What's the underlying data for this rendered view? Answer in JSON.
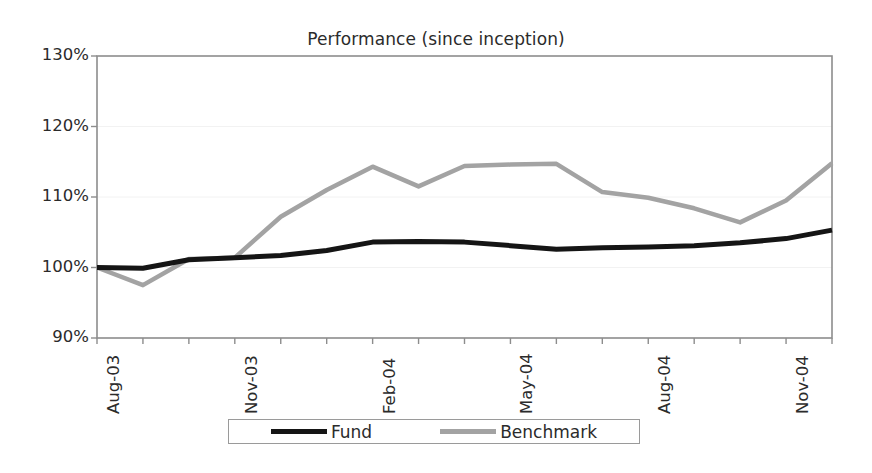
{
  "chart_data": {
    "type": "line",
    "title": "Performance (since inception)",
    "xlabel": "",
    "ylabel": "",
    "ylim": [
      90,
      130
    ],
    "ytick_values": [
      90,
      100,
      110,
      120,
      130
    ],
    "ytick_labels": [
      "90%",
      "100%",
      "110%",
      "120%",
      "130%"
    ],
    "grid": true,
    "legend_position": "bottom",
    "x": [
      "Aug-03",
      "Sep-03",
      "Oct-03",
      "Nov-03",
      "Dec-03",
      "Jan-04",
      "Feb-04",
      "Mar-04",
      "Apr-04",
      "May-04",
      "Jun-04",
      "Jul-04",
      "Aug-04",
      "Sep-04",
      "Oct-04",
      "Nov-04",
      "Dec-04"
    ],
    "xtick_labels": [
      "Aug-03",
      "Nov-03",
      "Feb-04",
      "May-04",
      "Aug-04",
      "Nov-04"
    ],
    "xtick_label_indices": [
      0,
      3,
      6,
      9,
      12,
      15
    ],
    "series": [
      {
        "name": "Fund",
        "color": "#151515",
        "values": [
          100.0,
          99.9,
          101.1,
          101.4,
          101.7,
          102.4,
          103.6,
          103.7,
          103.6,
          103.1,
          102.6,
          102.8,
          102.9,
          103.1,
          103.5,
          104.1,
          105.3
        ]
      },
      {
        "name": "Benchmark",
        "color": "#a3a3a3",
        "values": [
          100.0,
          97.5,
          101.2,
          101.4,
          107.2,
          111.0,
          114.3,
          111.5,
          114.4,
          114.6,
          114.7,
          110.7,
          109.9,
          108.4,
          106.4,
          109.5,
          114.8
        ]
      }
    ]
  },
  "legend": {
    "items": [
      {
        "label": "Fund"
      },
      {
        "label": "Benchmark"
      }
    ]
  }
}
